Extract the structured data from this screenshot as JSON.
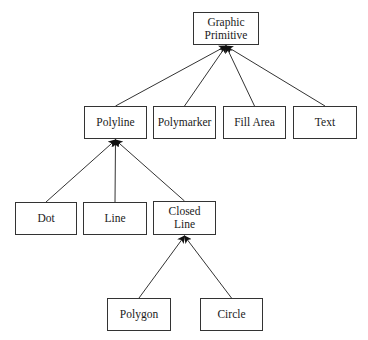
{
  "diagram": {
    "type": "class-hierarchy-tree",
    "nodes": [
      {
        "id": "graphic_primitive",
        "label": "Graphic\nPrimitive",
        "x": 193,
        "y": 12,
        "w": 66,
        "h": 33
      },
      {
        "id": "polyline",
        "label": "Polyline",
        "x": 84,
        "y": 106,
        "w": 63,
        "h": 33
      },
      {
        "id": "polymarker",
        "label": "Polymarker",
        "x": 153,
        "y": 106,
        "w": 63,
        "h": 33
      },
      {
        "id": "fill_area",
        "label": "Fill Area",
        "x": 223,
        "y": 106,
        "w": 63,
        "h": 33
      },
      {
        "id": "text",
        "label": "Text",
        "x": 293,
        "y": 106,
        "w": 64,
        "h": 33
      },
      {
        "id": "dot",
        "label": "Dot",
        "x": 15,
        "y": 202,
        "w": 62,
        "h": 33
      },
      {
        "id": "line",
        "label": "Line",
        "x": 83,
        "y": 202,
        "w": 64,
        "h": 33
      },
      {
        "id": "closed_line",
        "label": "Closed\nLine",
        "x": 153,
        "y": 201,
        "w": 63,
        "h": 34
      },
      {
        "id": "polygon",
        "label": "Polygon",
        "x": 107,
        "y": 298,
        "w": 64,
        "h": 33
      },
      {
        "id": "circle",
        "label": "Circle",
        "x": 200,
        "y": 298,
        "w": 63,
        "h": 33
      }
    ],
    "edges": [
      {
        "from": "polyline",
        "to": "graphic_primitive"
      },
      {
        "from": "polymarker",
        "to": "graphic_primitive"
      },
      {
        "from": "fill_area",
        "to": "graphic_primitive"
      },
      {
        "from": "text",
        "to": "graphic_primitive"
      },
      {
        "from": "dot",
        "to": "polyline"
      },
      {
        "from": "line",
        "to": "polyline"
      },
      {
        "from": "closed_line",
        "to": "polyline"
      },
      {
        "from": "polygon",
        "to": "closed_line"
      },
      {
        "from": "circle",
        "to": "closed_line"
      }
    ],
    "colors": {
      "stroke": "#333333",
      "arrowhead": "#111111",
      "background": "#ffffff"
    }
  }
}
